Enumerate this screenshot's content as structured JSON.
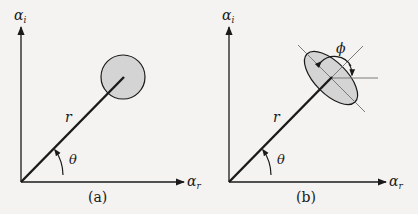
{
  "colors": {
    "background": "#f4f3f1",
    "ink": "#1a1a1a",
    "fill": "#d4d4d4",
    "guide": "#7a7a7a"
  },
  "panels": [
    {
      "id": "a",
      "caption": "(a)",
      "y_axis_label": "α",
      "y_axis_sub": "i",
      "x_axis_label": "α",
      "x_axis_sub": "r",
      "radius_label": "r",
      "angle_label": "θ",
      "shape": "circle"
    },
    {
      "id": "b",
      "caption": "(b)",
      "y_axis_label": "α",
      "y_axis_sub": "i",
      "x_axis_label": "α",
      "x_axis_sub": "r",
      "radius_label": "r",
      "angle_label": "θ",
      "orientation_label": "ϕ",
      "shape": "ellipse"
    }
  ]
}
